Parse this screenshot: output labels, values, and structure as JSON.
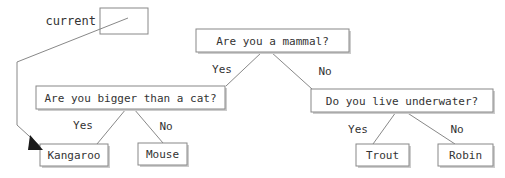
{
  "diagram": {
    "type": "decision-tree",
    "variable": {
      "label": "current",
      "box_empty_value": "",
      "points_to": "Kangaroo"
    },
    "nodes": [
      {
        "id": "root",
        "text": "Are you a mammal?",
        "kind": "question",
        "x": 196,
        "y": 29,
        "w": 153,
        "h": 23
      },
      {
        "id": "bigger",
        "text": "Are you bigger than a cat?",
        "kind": "question",
        "x": 36,
        "y": 86,
        "w": 189,
        "h": 23
      },
      {
        "id": "underwater",
        "text": "Do you live underwater?",
        "kind": "question",
        "x": 311,
        "y": 89,
        "w": 182,
        "h": 23
      },
      {
        "id": "kangaroo",
        "text": "Kangaroo",
        "kind": "leaf",
        "x": 40,
        "y": 144,
        "w": 68,
        "h": 22
      },
      {
        "id": "mouse",
        "text": "Mouse",
        "kind": "leaf",
        "x": 138,
        "y": 143,
        "w": 49,
        "h": 22
      },
      {
        "id": "trout",
        "text": "Trout",
        "kind": "leaf",
        "x": 356,
        "y": 144,
        "w": 53,
        "h": 22
      },
      {
        "id": "robin",
        "text": "Robin",
        "kind": "leaf",
        "x": 438,
        "y": 144,
        "w": 55,
        "h": 22
      }
    ],
    "edges": [
      {
        "from": "root",
        "to": "bigger",
        "label": "Yes",
        "x1": 262,
        "y1": 52,
        "x2": 226,
        "y2": 86,
        "lx": 222,
        "ly": 70
      },
      {
        "from": "root",
        "to": "underwater",
        "label": "No",
        "x1": 271,
        "y1": 52,
        "x2": 312,
        "y2": 89,
        "lx": 325,
        "ly": 72
      },
      {
        "from": "bigger",
        "to": "kangaroo",
        "label": "Yes",
        "x1": 126,
        "y1": 109,
        "x2": 97,
        "y2": 144,
        "lx": 83,
        "ly": 126
      },
      {
        "from": "bigger",
        "to": "mouse",
        "label": "No",
        "x1": 134,
        "y1": 109,
        "x2": 163,
        "y2": 143,
        "lx": 166,
        "ly": 127
      },
      {
        "from": "underwater",
        "to": "trout",
        "label": "Yes",
        "x1": 396,
        "y1": 112,
        "x2": 373,
        "y2": 144,
        "lx": 358,
        "ly": 130
      },
      {
        "from": "underwater",
        "to": "robin",
        "label": "No",
        "x1": 406,
        "y1": 112,
        "x2": 455,
        "y2": 144,
        "lx": 457,
        "ly": 130
      }
    ],
    "variable_box": {
      "x": 100,
      "y": 8,
      "w": 48,
      "h": 26
    },
    "variable_label_pos": {
      "x": 96,
      "y": 21
    },
    "pointer_path": "M 128 18 L 17 62 L 17 125 L 40 146",
    "pointer_arrow": "30,135 43,150 28,150"
  },
  "colors": {
    "box_stroke": "#888888",
    "box_fill": "#ffffff",
    "text": "#333333",
    "arrow": "#1a1a1a",
    "background": "#ffffff"
  }
}
